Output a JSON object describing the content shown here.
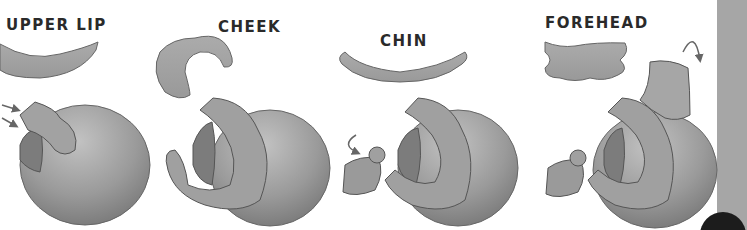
{
  "figure": {
    "type": "step-by-step sculpting illustration",
    "colors": {
      "clay": "#9c9c9c",
      "clay_light": "#b8b8b8",
      "clay_dark": "#7a7a7a",
      "outline": "#555555",
      "label": "#2a2a2a",
      "side_bar": "#a6a6a6"
    },
    "panels": [
      {
        "label": "UPPER LIP",
        "piece": "upper-lip-strip",
        "arrows": "two arrows pointing in"
      },
      {
        "label": "CHEEK",
        "piece": "cheek-crescent",
        "arrows": ""
      },
      {
        "label": "CHIN",
        "piece": "chin-arc",
        "arrows": "curved two-way arrow"
      },
      {
        "label": "FOREHEAD",
        "piece": "forehead-band",
        "arrows": "curved two-way arrow"
      }
    ]
  }
}
